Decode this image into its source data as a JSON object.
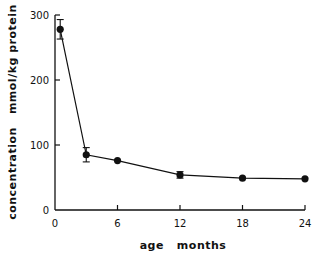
{
  "chart_data": {
    "type": "line",
    "title": "",
    "xlabel": "age   months",
    "ylabel": "concentration   mmol/kg protein",
    "x": [
      0.5,
      3,
      6,
      12,
      18,
      24
    ],
    "series": [
      {
        "name": "concentration",
        "values": [
          278,
          85,
          76,
          54,
          49,
          48
        ],
        "error": [
          15,
          11,
          0,
          5,
          0,
          0
        ]
      }
    ],
    "xlim": [
      0,
      24
    ],
    "ylim": [
      0,
      300
    ],
    "xticks": [
      0,
      6,
      12,
      18,
      24
    ],
    "yticks": [
      0,
      100,
      200,
      300
    ],
    "grid": false,
    "legend": null
  },
  "axes": {
    "x_title": "age   months",
    "y_title": "concentration   mmol/kg protein",
    "x_tick_labels": [
      "0",
      "6",
      "12",
      "18",
      "24"
    ],
    "y_tick_labels": [
      "0",
      "100",
      "200",
      "300"
    ]
  },
  "colors": {
    "line": "#111111",
    "background": "#ffffff"
  }
}
